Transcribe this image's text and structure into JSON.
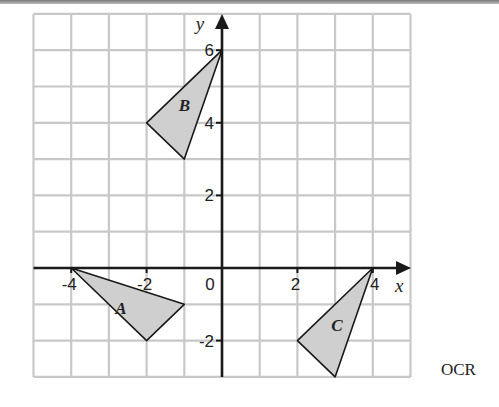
{
  "figure": {
    "x_axis_label": "x",
    "y_axis_label": "y",
    "x_tick_labels": [
      "-4",
      "-2",
      "0",
      "2",
      "4"
    ],
    "y_tick_labels": [
      "6",
      "4",
      "2",
      "-2"
    ],
    "grid": {
      "x_min": -5,
      "x_max": 5,
      "y_min": -3,
      "y_max": 7,
      "step": 1
    },
    "shapes": [
      {
        "label": "A",
        "vertices": [
          [
            -4,
            0
          ],
          [
            -1,
            -1
          ],
          [
            -2,
            -2
          ]
        ]
      },
      {
        "label": "B",
        "vertices": [
          [
            0,
            6
          ],
          [
            -2,
            4
          ],
          [
            -1,
            3
          ]
        ]
      },
      {
        "label": "C",
        "vertices": [
          [
            4,
            0
          ],
          [
            2,
            -2
          ],
          [
            3,
            -3
          ]
        ]
      }
    ],
    "credit": "OCR"
  },
  "colors": {
    "grid": "#c8c8c8",
    "axis": "#1a1a1a",
    "shape_fill": "#cfcfcf",
    "shape_stroke": "#1a1a1a"
  }
}
